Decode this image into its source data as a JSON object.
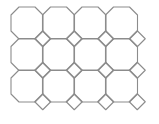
{
  "diagram": {
    "type": "truncated-square-tiling",
    "stroke_color": "#8c8c8c",
    "background": "#ffffff",
    "grid": {
      "columns": 4,
      "rows": 3,
      "origin_x": 27,
      "origin_y": 23,
      "period": 31.5,
      "octagon_half_width": 16,
      "corner_cut": 8
    },
    "square_positions": [
      [
        0,
        0
      ],
      [
        1,
        0
      ],
      [
        2,
        0
      ],
      [
        3,
        0
      ],
      [
        0,
        1
      ],
      [
        1,
        1
      ],
      [
        2,
        1
      ],
      [
        3,
        1
      ],
      [
        0,
        2
      ],
      [
        1,
        2
      ],
      [
        2,
        2
      ],
      [
        3,
        2
      ]
    ]
  }
}
